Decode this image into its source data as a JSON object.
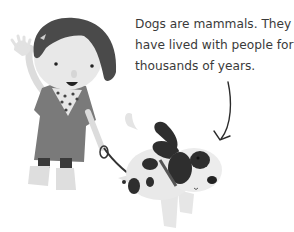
{
  "caption": {
    "lines": [
      "Dogs are mammals. They",
      "have lived with people for",
      "thousands of years."
    ]
  },
  "illustration": {
    "girl": "girl-waving-with-leash",
    "dog": "spotted-dog-jumping",
    "arrow": "curved-arrow-pointing-to-dog"
  },
  "colors": {
    "text": "#3a3a3a",
    "background": "#ffffff"
  }
}
